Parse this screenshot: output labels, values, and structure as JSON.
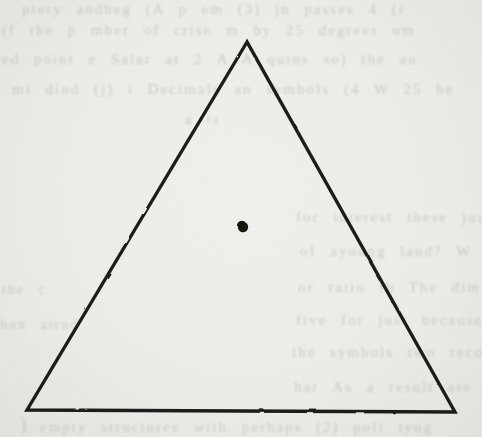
{
  "page": {
    "kind": "scanned book figure",
    "background_color": "#efeeea",
    "ink_color": "#1d1c1a"
  },
  "figure": {
    "triangle": {
      "points_px": "247,42 27,410 455,412",
      "stroke_width": "3.4",
      "fill": "none"
    },
    "dot": {
      "cx": "243",
      "cy": "227",
      "r": "5.2",
      "color": "#15140f"
    }
  },
  "bleed_through": {
    "legibility": "faint show-through text from reverse page, mostly illegible",
    "lines": [
      {
        "text": "ptery andbeg   (A  p em   (3) jn passes  4 (i",
        "left": 22,
        "top": 2,
        "width": 456,
        "size": 15
      },
      {
        "text": "(f the p mber of crise m   by 25 degrees  um",
        "left": 2,
        "top": 23,
        "width": 476,
        "size": 15
      },
      {
        "text": "ed point e  Salar at 2 A  A quins  so) the  au",
        "left": 2,
        "top": 52,
        "width": 478,
        "size": 15
      },
      {
        "text": "mi dind  (j) i  Decimals an  symbols (4 W 25 be",
        "left": 12,
        "top": 82,
        "width": 468,
        "size": 15
      },
      {
        "text": "g  ra",
        "left": 185,
        "top": 112,
        "width": 110,
        "size": 13
      },
      {
        "text": "for interest these just some",
        "left": 296,
        "top": 210,
        "width": 186,
        "size": 15
      },
      {
        "text": "of ayoung  land?   W",
        "left": 300,
        "top": 244,
        "width": 182,
        "size": 15
      },
      {
        "text": "or  ratio th   The  dim",
        "left": 298,
        "top": 280,
        "width": 184,
        "size": 15
      },
      {
        "text": "five  for just because  (1) that",
        "left": 296,
        "top": 313,
        "width": 186,
        "size": 15
      },
      {
        "text": "the  symbols  two recomb  th  c",
        "left": 292,
        "top": 345,
        "width": 190,
        "size": 15
      },
      {
        "text": "har  As a result  are  reduce",
        "left": 294,
        "top": 380,
        "width": 188,
        "size": 15
      },
      {
        "text": "the c",
        "left": 2,
        "top": 283,
        "width": 60,
        "size": 14
      },
      {
        "text": "hun  airud",
        "left": 0,
        "top": 318,
        "width": 80,
        "size": 14
      },
      {
        "text": ")",
        "left": 20,
        "top": 414,
        "width": 20,
        "size": 20
      },
      {
        "text": "empty structures with  perhaps  (2) poli  tyng",
        "left": 40,
        "top": 420,
        "width": 440,
        "size": 15
      }
    ]
  }
}
